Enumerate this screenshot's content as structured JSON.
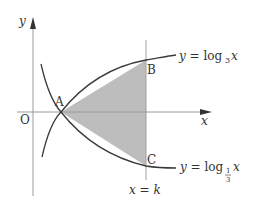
{
  "diagram": {
    "type": "function-graph",
    "axes": {
      "x_label": "x",
      "y_label": "y",
      "origin_label": "O"
    },
    "curves": [
      {
        "name": "log3",
        "equation_prefix": "y = log",
        "base": "3",
        "var": "x"
      },
      {
        "name": "log_one_third",
        "equation_prefix": "y = log",
        "base_num": "1",
        "base_den": "3",
        "var": "x"
      }
    ],
    "points": {
      "A": "A",
      "B": "B",
      "C": "C"
    },
    "vertical_line_label": "x = k",
    "shaded_region": "triangle ABC",
    "colors": {
      "curve": "#3a3a3a",
      "axis": "#9a9a9a",
      "vertical_line": "#a0a0a0",
      "shade": "#bdbdbd",
      "text": "#333333"
    }
  }
}
